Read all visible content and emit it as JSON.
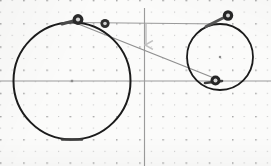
{
  "figure": {
    "canvas": {
      "width": 271,
      "height": 166
    },
    "background_color": "#fbfbfa"
  },
  "grid": {
    "style": "dotted",
    "minor_spacing": 11.6,
    "major_spacing": 23.2,
    "origin_x": 144.5,
    "origin_y": 81.0,
    "minor_color": "#c9c9c9",
    "major_color": "#a9a9a9",
    "visible": true
  },
  "axes": {
    "color": "#9b9b9b",
    "x_axis": {
      "label": "x-axis",
      "y": 81.0,
      "x_start": 0,
      "x_end": 271
    },
    "y_axis": {
      "label": "y-axis",
      "x": 144.5,
      "y_start": 8,
      "y_end": 166
    }
  },
  "annotations": {
    "arrow": {
      "name": "down-arrow",
      "direction": "down",
      "x": 146.0,
      "y_start": 24.0,
      "y_end": 45.0,
      "color": "#c2c2c2"
    }
  },
  "shapes": {
    "large_circle": {
      "label": "large circle",
      "cx": 72.0,
      "cy": 81.0,
      "r": 58.5,
      "stroke": "#1b1b1b",
      "stroke_width": 2.0,
      "fill": "none",
      "center_mark": {
        "name": "center-dot",
        "size": 2.4,
        "color": "#8c8c8c"
      }
    },
    "small_circle": {
      "label": "small circle",
      "cx": 220.0,
      "cy": 57.0,
      "r": 33.0,
      "stroke": "#1b1b1b",
      "stroke_width": 1.8,
      "fill": "none",
      "center_mark": {
        "name": "center-dot",
        "size": 2.2,
        "color": "#8c8c8c"
      }
    }
  },
  "tangent_lines": [
    {
      "name": "upper-tangent-line",
      "x1": 76.0,
      "y1": 22.5,
      "x2": 223.0,
      "y2": 24.0,
      "color": "#9a9a9a",
      "width": 1.2
    },
    {
      "name": "crossing-tangent-line",
      "x1": 77.0,
      "y1": 23.5,
      "x2": 219.0,
      "y2": 80.0,
      "color": "#8f8f8f",
      "width": 1.3
    }
  ],
  "markers": [
    {
      "name": "tangent-point-upper-left",
      "x": 78.0,
      "y": 19.5,
      "outer_r": 5.4,
      "inner_r": 2.1,
      "outer_color": "#2a2a2a",
      "inner_color": "#d8d8d8"
    },
    {
      "name": "tangent-point-secondary",
      "x": 105.0,
      "y": 23.5,
      "outer_r": 4.6,
      "inner_r": 1.8,
      "outer_color": "#2f2f2f",
      "inner_color": "#d2d2d2"
    },
    {
      "name": "tangent-point-upper-right",
      "x": 228.0,
      "y": 15.5,
      "outer_r": 5.2,
      "inner_r": 2.0,
      "outer_color": "#262626",
      "inner_color": "#d6d6d6"
    },
    {
      "name": "tangent-point-lower-right",
      "x": 215.5,
      "y": 80.5,
      "outer_r": 5.0,
      "inner_r": 2.0,
      "outer_color": "#262626",
      "inner_color": "#d6d6d6"
    }
  ],
  "chord_segments": [
    {
      "name": "chord-large-circle-top",
      "x1": 62.0,
      "y1": 24.0,
      "x2": 78.0,
      "y2": 19.8,
      "color": "#4a4a4a",
      "width": 3.0
    },
    {
      "name": "chord-small-circle-top",
      "x1": 206.0,
      "y1": 26.5,
      "x2": 226.0,
      "y2": 16.5,
      "color": "#545454",
      "width": 3.0
    },
    {
      "name": "chord-small-circle-bottom",
      "x1": 205.0,
      "y1": 83.0,
      "x2": 222.0,
      "y2": 81.0,
      "color": "#3d3d3d",
      "width": 2.6
    },
    {
      "name": "chord-large-circle-bottom",
      "x1": 62.0,
      "y1": 139.5,
      "x2": 82.0,
      "y2": 139.5,
      "color": "#3d3d3d",
      "width": 2.4
    }
  ]
}
